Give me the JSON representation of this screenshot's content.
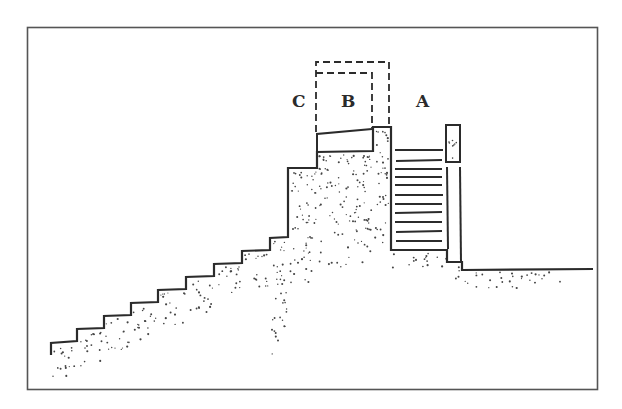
{
  "figure": {
    "type": "archaeological section drawing",
    "labels": {
      "a": "A",
      "b": "B",
      "c": "C"
    },
    "colors": {
      "ink": "#2b2b2b",
      "frame": "#555555",
      "background": "#ffffff"
    }
  }
}
